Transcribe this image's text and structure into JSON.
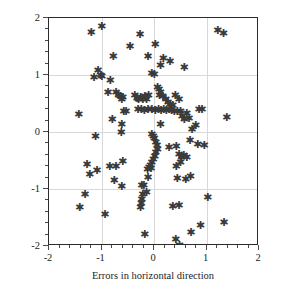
{
  "chart_data": {
    "type": "scatter",
    "title": "",
    "xlabel": "Errors in horizontal direction",
    "ylabel": "Errors in depth direction",
    "xlim": [
      -2,
      2
    ],
    "ylim": [
      -2,
      2
    ],
    "xticks": [
      -2,
      -1,
      0,
      1,
      2
    ],
    "yticks": [
      -2,
      -1,
      0,
      1,
      2
    ],
    "xtick_labels": [
      "-2",
      "-1",
      "0",
      "1",
      "2"
    ],
    "ytick_labels": [
      "-2",
      "-1",
      "0",
      "1",
      "2"
    ],
    "x_minor_tick_step": 0.2,
    "y_minor_tick_step": 0.2,
    "grid": true,
    "grid_color": "#d8d8d8",
    "marker": "asterisk",
    "marker_glyph": "✳",
    "marker_color": "#3a3a3a",
    "axis_color": "#2b2b2b",
    "legend": null,
    "n_points": 124,
    "points": [
      [
        -1.2,
        1.72
      ],
      [
        -1.0,
        1.84
      ],
      [
        -0.78,
        1.31
      ],
      [
        -0.46,
        1.48
      ],
      [
        -0.27,
        1.69
      ],
      [
        -0.12,
        1.31
      ],
      [
        0.02,
        1.51
      ],
      [
        0.12,
        1.15
      ],
      [
        0.17,
        1.27
      ],
      [
        0.3,
        1.22
      ],
      [
        0.57,
        1.12
      ],
      [
        1.21,
        1.76
      ],
      [
        1.32,
        1.71
      ],
      [
        -1.15,
        0.93
      ],
      [
        -1.07,
        1.06
      ],
      [
        -1.02,
        0.98
      ],
      [
        -1.0,
        0.96
      ],
      [
        -0.84,
        0.88
      ],
      [
        -0.88,
        0.67
      ],
      [
        -0.73,
        0.68
      ],
      [
        -0.68,
        0.62
      ],
      [
        -0.65,
        0.6
      ],
      [
        -0.6,
        0.58
      ],
      [
        -0.62,
        0.56
      ],
      [
        -0.37,
        0.62
      ],
      [
        -0.33,
        0.57
      ],
      [
        -0.3,
        0.55
      ],
      [
        -0.26,
        0.58
      ],
      [
        -0.22,
        0.56
      ],
      [
        -0.18,
        0.6
      ],
      [
        -0.15,
        0.55
      ],
      [
        -0.11,
        0.63
      ],
      [
        -0.05,
        1.01
      ],
      [
        0.0,
        1.0
      ],
      [
        0.06,
        0.77
      ],
      [
        0.09,
        0.72
      ],
      [
        0.12,
        0.68
      ],
      [
        0.1,
        0.62
      ],
      [
        0.16,
        0.6
      ],
      [
        0.22,
        0.55
      ],
      [
        0.26,
        0.5
      ],
      [
        0.3,
        0.47
      ],
      [
        0.35,
        0.44
      ],
      [
        0.4,
        0.62
      ],
      [
        0.47,
        0.56
      ],
      [
        0.5,
        0.35
      ],
      [
        0.44,
        0.35
      ],
      [
        0.38,
        0.35
      ],
      [
        0.33,
        0.36
      ],
      [
        0.28,
        0.37
      ],
      [
        0.23,
        0.36
      ],
      [
        0.18,
        0.37
      ],
      [
        0.13,
        0.36
      ],
      [
        0.08,
        0.37
      ],
      [
        0.02,
        0.36
      ],
      [
        -0.05,
        0.38
      ],
      [
        -0.12,
        0.37
      ],
      [
        -0.19,
        0.36
      ],
      [
        -0.25,
        0.38
      ],
      [
        -0.31,
        0.37
      ],
      [
        -0.54,
        0.35
      ],
      [
        -0.58,
        0.34
      ],
      [
        -1.44,
        0.29
      ],
      [
        -0.8,
        0.2
      ],
      [
        -0.62,
        0.11
      ],
      [
        0.12,
        0.12
      ],
      [
        0.53,
        0.26
      ],
      [
        0.57,
        0.2
      ],
      [
        0.62,
        0.3
      ],
      [
        0.66,
        0.22
      ],
      [
        0.85,
        0.38
      ],
      [
        0.91,
        0.37
      ],
      [
        0.79,
        0.1
      ],
      [
        0.72,
        0.03
      ],
      [
        1.38,
        0.23
      ],
      [
        -0.63,
        -0.02
      ],
      [
        -1.12,
        -0.1
      ],
      [
        -0.05,
        -0.06
      ],
      [
        -0.02,
        -0.09
      ],
      [
        0.0,
        -0.14
      ],
      [
        0.03,
        -0.2
      ],
      [
        0.05,
        -0.26
      ],
      [
        0.06,
        -0.32
      ],
      [
        0.03,
        -0.38
      ],
      [
        0.01,
        -0.44
      ],
      [
        -0.02,
        -0.5
      ],
      [
        -0.05,
        -0.55
      ],
      [
        -0.07,
        -0.6
      ],
      [
        -0.1,
        -0.64
      ],
      [
        -0.13,
        -0.68
      ],
      [
        0.28,
        -0.29
      ],
      [
        0.42,
        -0.27
      ],
      [
        0.68,
        -0.17
      ],
      [
        0.83,
        -0.24
      ],
      [
        0.95,
        -0.25
      ],
      [
        0.47,
        -0.42
      ],
      [
        0.52,
        -0.46
      ],
      [
        0.56,
        -0.43
      ],
      [
        0.62,
        -0.47
      ],
      [
        0.5,
        -0.56
      ],
      [
        0.42,
        -0.62
      ],
      [
        -0.73,
        -0.62
      ],
      [
        -0.85,
        -0.63
      ],
      [
        -1.28,
        -0.59
      ],
      [
        -1.23,
        -0.76
      ],
      [
        -1.09,
        -0.7
      ],
      [
        -0.6,
        -0.53
      ],
      [
        -0.06,
        -0.66
      ],
      [
        -0.12,
        -0.81
      ],
      [
        0.44,
        -0.84
      ],
      [
        0.6,
        -0.85
      ],
      [
        0.69,
        -0.8
      ],
      [
        -0.76,
        -0.86
      ],
      [
        -0.62,
        -0.98
      ],
      [
        -0.24,
        -0.96
      ],
      [
        -0.2,
        -0.95
      ],
      [
        -0.15,
        -1.08
      ],
      [
        -0.22,
        -1.11
      ],
      [
        -0.24,
        -1.2
      ],
      [
        -0.25,
        -1.27
      ],
      [
        -0.26,
        -1.34
      ],
      [
        -1.32,
        -1.12
      ],
      [
        -1.42,
        -1.35
      ],
      [
        -0.94,
        -1.47
      ],
      [
        0.35,
        -1.32
      ],
      [
        0.47,
        -1.3
      ],
      [
        1.02,
        -1.16
      ],
      [
        -0.18,
        -1.81
      ],
      [
        0.41,
        -1.91
      ],
      [
        0.7,
        -1.78
      ],
      [
        0.88,
        -1.66
      ],
      [
        1.33,
        -1.6
      ],
      [
        0.48,
        -2.0
      ]
    ]
  }
}
